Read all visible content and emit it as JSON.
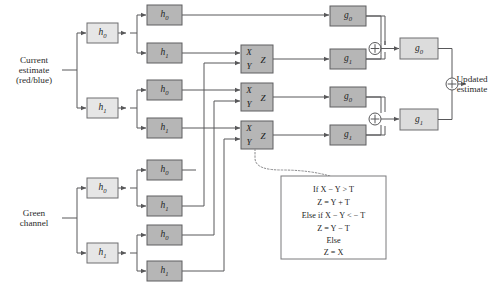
{
  "figure": {
    "background": "#ffffff",
    "colors": {
      "wire": "#58585a",
      "box_stage1_fill": "#e6e6e6",
      "box_stage2_fill": "#b6b6b6",
      "box_g_fill": "#dcdcdc",
      "note_border": "#7a7a7c",
      "text": "#2b2b2b"
    }
  },
  "inputs": {
    "current_estimate": {
      "line1": "Current",
      "line2": "estimate",
      "line3": "(red/blue)"
    },
    "green_channel": {
      "line1": "Green",
      "line2": "channel"
    }
  },
  "output": {
    "line1": "Updated",
    "line2": "estimate"
  },
  "analysis_filters": {
    "top_stage1": [
      {
        "base": "h",
        "sub": "0"
      },
      {
        "base": "h",
        "sub": "1"
      }
    ],
    "top_stage2": [
      {
        "base": "h",
        "sub": "0"
      },
      {
        "base": "h",
        "sub": "1"
      },
      {
        "base": "h",
        "sub": "0"
      },
      {
        "base": "h",
        "sub": "1"
      }
    ],
    "bottom_stage1": [
      {
        "base": "h",
        "sub": "0"
      },
      {
        "base": "h",
        "sub": "1"
      }
    ],
    "bottom_stage2": [
      {
        "base": "h",
        "sub": "0"
      },
      {
        "base": "h",
        "sub": "1"
      },
      {
        "base": "h",
        "sub": "0"
      },
      {
        "base": "h",
        "sub": "1"
      }
    ]
  },
  "threshold_blocks": [
    {
      "x_label": "X",
      "y_label": "Y",
      "z_label": "Z"
    },
    {
      "x_label": "X",
      "y_label": "Y",
      "z_label": "Z"
    },
    {
      "x_label": "X",
      "y_label": "Y",
      "z_label": "Z"
    }
  ],
  "synthesis_filters": {
    "stage1": [
      {
        "base": "g",
        "sub": "0"
      },
      {
        "base": "g",
        "sub": "1"
      },
      {
        "base": "g",
        "sub": "0"
      },
      {
        "base": "g",
        "sub": "1"
      }
    ],
    "stage2": [
      {
        "base": "g",
        "sub": "0"
      },
      {
        "base": "g",
        "sub": "1"
      }
    ]
  },
  "adders": {
    "symbol": "+",
    "count": 3
  },
  "note": {
    "lines": [
      {
        "text": "If X − Y > T",
        "italics": [
          "X",
          "Y",
          "T"
        ]
      },
      {
        "text": "Z = Y + T",
        "italics": [
          "Z",
          "Y",
          "T"
        ]
      },
      {
        "text": "Else if X − Y < − T",
        "italics": [
          "X",
          "Y",
          "T"
        ]
      },
      {
        "text": "Z = Y − T",
        "italics": [
          "Z",
          "Y",
          "T"
        ]
      },
      {
        "text": "Else",
        "italics": []
      },
      {
        "text": "Z = X",
        "italics": [
          "Z",
          "X"
        ]
      }
    ]
  }
}
